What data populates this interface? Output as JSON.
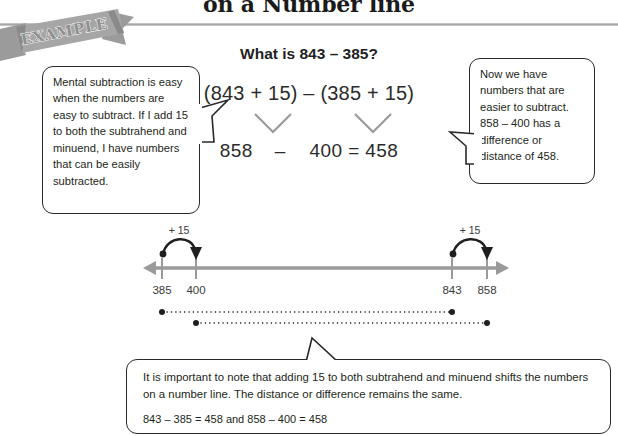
{
  "header": {
    "title": "on a Number line",
    "ribbon_label": "EXAMPLE"
  },
  "math": {
    "question": "What is 843 – 385?",
    "expression": "(843 + 15) – (385 + 15)",
    "result_left": "858",
    "result_operator": "–",
    "result_right": "400 = 458"
  },
  "callouts": {
    "left": "Mental subtraction is easy when the numbers are easy to subtract. If I add 15 to both the subtrahend and minuend, I have numbers that can be easily subtracted.",
    "right": "Now we have numbers that are easier to subtract. 858 – 400 has a difference or distance of 458.",
    "bottom_paragraph": "It is important to note that adding 15 to both subtrahend and minuend shifts the numbers on a number line. The distance or difference remains the same.",
    "bottom_equation": "843 – 385 = 458 and 858 – 400 = 458"
  },
  "numberline": {
    "ticks": [
      {
        "label": "385",
        "x": 162
      },
      {
        "label": "400",
        "x": 196
      },
      {
        "label": "843",
        "x": 452
      },
      {
        "label": "858",
        "x": 487
      }
    ],
    "jumps": [
      {
        "label": "+ 15",
        "from_x": 162,
        "to_x": 196
      },
      {
        "label": "+ 15",
        "from_x": 452,
        "to_x": 487
      }
    ],
    "distance_bars": [
      {
        "from_x": 162,
        "to_x": 452
      },
      {
        "from_x": 196,
        "to_x": 487
      }
    ],
    "axis_start_x": 143,
    "axis_end_x": 509
  },
  "colors": {
    "axis": "#9a9a9a",
    "ink": "#231f20",
    "ribbon": "#8f8f8f",
    "rule": "#b5b5b5"
  }
}
